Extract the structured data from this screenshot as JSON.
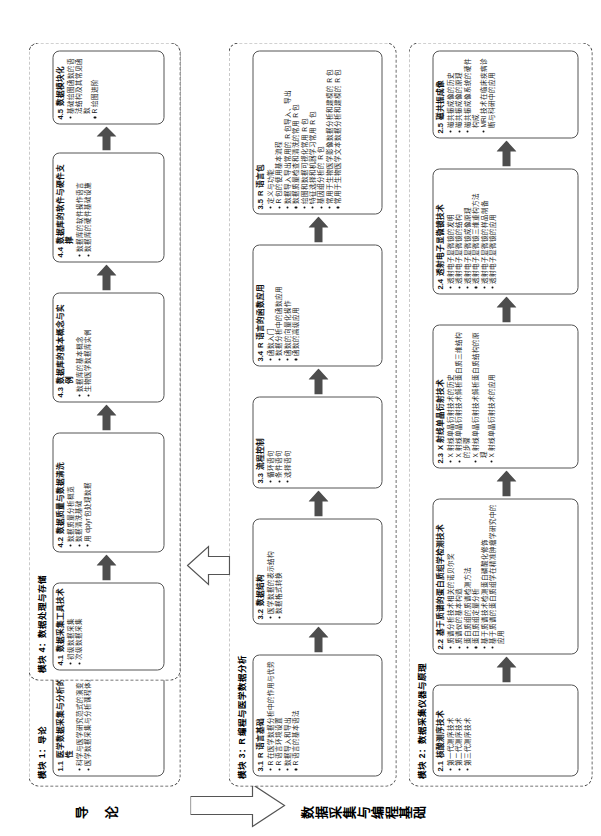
{
  "poster": {
    "bands": [
      {
        "name": "band-intro",
        "label": "导 论"
      },
      {
        "name": "band-data",
        "label": "数据采集与编程基础"
      }
    ]
  },
  "modules": [
    {
      "id": "m1",
      "title": "模块 1：导论",
      "nodes": [
        {
          "num": "1.1",
          "title": "医学数据采集与分析的重要性",
          "bullets": [
            "科学与医学研究范式的演变",
            "医学数据采集与分析课程体系"
          ]
        },
        {
          "num": "1.2",
          "title": "医学数据科学的概念与基本工具",
          "bullets": [
            "医学数据科学简介",
            "医院多样性数据的采集",
            "医学数据共享与隐私保护"
          ]
        },
        {
          "num": "1.3",
          "title": "R 语言、Python 语言和 Matlab 等计算机编程语言在医学数据科学中的应用",
          "bullets": [
            "R 语言",
            "Python 语言",
            "Matlab 语言"
          ]
        },
        {
          "num": "1.4",
          "title": "医学数据的多样化演变",
          "bullets": [
            "WHO 的健康定义与健康方程式",
            "医学数据的多模态"
          ]
        },
        {
          "num": "1.5",
          "title": "课程概览和目标",
          "bullets": [
            "数据的层次与课程设计思路",
            "本课程相关的学科生态与学习方法"
          ]
        }
      ]
    },
    {
      "id": "m2",
      "title": "模块 2：数据采集仪器与原理",
      "nodes": [
        {
          "num": "2.1",
          "title": "核酸测序技术",
          "bullets": [
            "第一代测序技术",
            "第二代测序技术",
            "第三代测序技术"
          ]
        },
        {
          "num": "2.2",
          "title": "基于质谱的蛋白质组学检测技术",
          "bullets": [
            "质谱分析技术相关的诺贝尔奖",
            "质谱仪的基本构造",
            "蛋白质组的质谱检测方法",
            "蛋白质组定量分析",
            "基于质谱技术检测蛋白磷酸化修饰",
            "基于质谱的蛋白质组学在精准肿瘤学研究中的应用"
          ]
        },
        {
          "num": "2.3",
          "title": "X 射线单晶衍射技术",
          "bullets": [
            "X 射线单晶衍射技术的历史",
            "X 射线单晶衍射技术解析蛋白质三维结构的步骤",
            "X 射线单晶衍射技术解析蛋白质结构的原理",
            "X 射线单晶衍射技术的应用"
          ]
        },
        {
          "num": "2.4",
          "title": "透射电子显微镜技术",
          "bullets": [
            "透射电子显微镜的发明",
            "透射电子显微镜的结构",
            "透射电子显微镜成像原理",
            "透射电子显微镜三维重构方法",
            "透射电子显微镜的样品制备",
            "透射电子显微镜的应用"
          ]
        },
        {
          "num": "2.5",
          "title": "磁共振成像",
          "bullets": [
            "磁共振成像的历史",
            "磁共振成像的原理",
            "磁共振成像系统的硬件构成",
            "MRI 技术在临床疾病诊断与科研中的应用"
          ]
        }
      ]
    },
    {
      "id": "m3",
      "title": "模块 3：R 编程与医学数据分析",
      "nodes": [
        {
          "num": "3.1",
          "title": "R 语言基础",
          "bullets": [
            "R 在医学数据分析中的作用与优势",
            "R 语言环境设置",
            "数据导入和导出",
            "R 语言的基本语法"
          ]
        },
        {
          "num": "3.2",
          "title": "数据结构",
          "bullets": [
            "医学数据的表示结构",
            "数据格式转换"
          ]
        },
        {
          "num": "3.3",
          "title": "流程控制",
          "bullets": [
            "循环语句",
            "条件语句",
            "选择语句"
          ]
        },
        {
          "num": "3.4",
          "title": "R 语言的函数应用",
          "bullets": [
            "函数入门",
            "数据分析中的函数应用",
            "函数的向量化操作",
            "函数的高级应用"
          ]
        },
        {
          "num": "3.5",
          "title": "R 语言包",
          "bullets": [
            "定义与功能",
            "R 包的使用基本流程",
            "数据导入导出常用的 R 包导入、导出",
            "数据质量检查和清洗的常用 R 包",
            "绘图和数据可视化常用 R 包",
            "特征选择和机器学习常用 R 包",
            "基因组分析的 R 包",
            "常用于生物医学影像数据分析和建模的 R 包",
            "常用于生物医学文本数据分析和建模的 R 包"
          ]
        }
      ]
    },
    {
      "id": "m4",
      "title": "模块 4：数据处理与存储",
      "nodes": [
        {
          "num": "4.1",
          "title": "数据采集工具技术",
          "bullets": [
            "初级数据采集",
            "次级数据采集"
          ]
        },
        {
          "num": "4.2",
          "title": "数据质量与数据清洗",
          "bullets": [
            "数据质量分析概览",
            "数据清洗基础",
            "用 dplyr 包处理数据"
          ]
        },
        {
          "num": "4.3",
          "title": "数据库的基本概念与实例",
          "bullets": [
            "数据库的基本概念",
            "生物医学数据库实例"
          ]
        },
        {
          "num": "4.4",
          "title": "数据库的软件与硬件支撑",
          "bullets": [
            "数据库的软件操作语言",
            "数据库的硬件基础设施"
          ]
        },
        {
          "num": "4.5",
          "title": "数据模块化",
          "bullets": [
            "基础绘图函数的语法结构及其常见函数",
            "R 绘图进阶"
          ]
        }
      ]
    }
  ],
  "colors": {
    "border": "#555555",
    "dashed": "#4a4a4a",
    "arrow": "#4d4d4d",
    "background": "#ffffff"
  }
}
